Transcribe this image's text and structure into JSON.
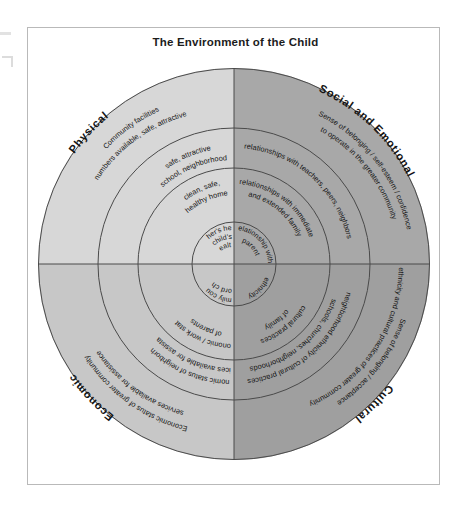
{
  "title": "The Environment of the Child",
  "colors": {
    "left_half": "#d7d7d7",
    "right_half": "#a8a8a8",
    "stroke": "#4a4a4a",
    "frame": "#b9b9b9",
    "text": "#141414",
    "background": "#ffffff"
  },
  "quadrants": {
    "physical": {
      "label": "Physical",
      "rings": [
        {
          "line1": "Community facilities",
          "line2": "numbers available, safe, attractive"
        },
        {
          "line1": "safe, attractive",
          "line2": "school, neighborhood"
        },
        {
          "line1": "clean, safe,",
          "line2": "healthy home"
        }
      ],
      "core": {
        "line1": "mother's health",
        "line2": "child's",
        "line3": "health"
      }
    },
    "social_emotional": {
      "label": "Social and Emotional",
      "rings": [
        {
          "line1": "Sense of belonging / self-esteem / confidence",
          "line2": "to operate in the greater community"
        },
        {
          "line1": "relationships with teachers, peers, neighbors",
          "line2": ""
        },
        {
          "line1": "relationships with immediate",
          "line2": "and extended family"
        }
      ],
      "core": {
        "line1": "relationship with",
        "line2": "parent",
        "line3": ""
      }
    },
    "economic": {
      "label": "Economic",
      "rings": [
        {
          "line1": "Economic status of greater community",
          "line2": "services available for assistance"
        },
        {
          "line1": "economic status of neighborhood",
          "line2": "services available for assistance"
        },
        {
          "line1": "economic / work status",
          "line2": "of parents"
        }
      ],
      "core": {
        "line1": "family could",
        "line2": "afford child",
        "line3": ""
      }
    },
    "cultural": {
      "label": "Cultural",
      "rings": [
        {
          "line1": "Sense of belonging / acceptance",
          "line2": "ethnicity and cultural practices of greater community"
        },
        {
          "line1": "neighborhood ethnicity of cultural practices",
          "line2": "schools, churches, neighborhoods"
        },
        {
          "line1": "cultural practices",
          "line2": "of family"
        }
      ],
      "core": {
        "line1": "ethnicity",
        "line2": "",
        "line3": ""
      }
    }
  }
}
